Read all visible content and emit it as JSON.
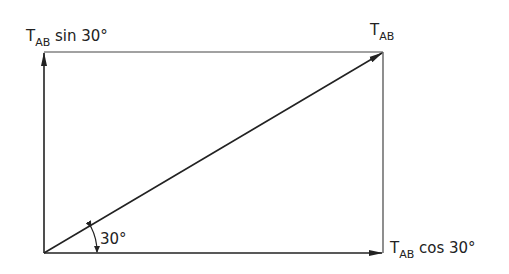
{
  "diagram": {
    "labels": {
      "vertical_component": {
        "main": "T",
        "sub": "AB",
        "rest": " sin 30°"
      },
      "resultant": {
        "main": "T",
        "sub": "AB"
      },
      "horizontal_component": {
        "main": "T",
        "sub": "AB",
        "rest": " cos 30°"
      },
      "angle": "30°"
    },
    "colors": {
      "line": "#333333",
      "background": "#ffffff"
    }
  }
}
